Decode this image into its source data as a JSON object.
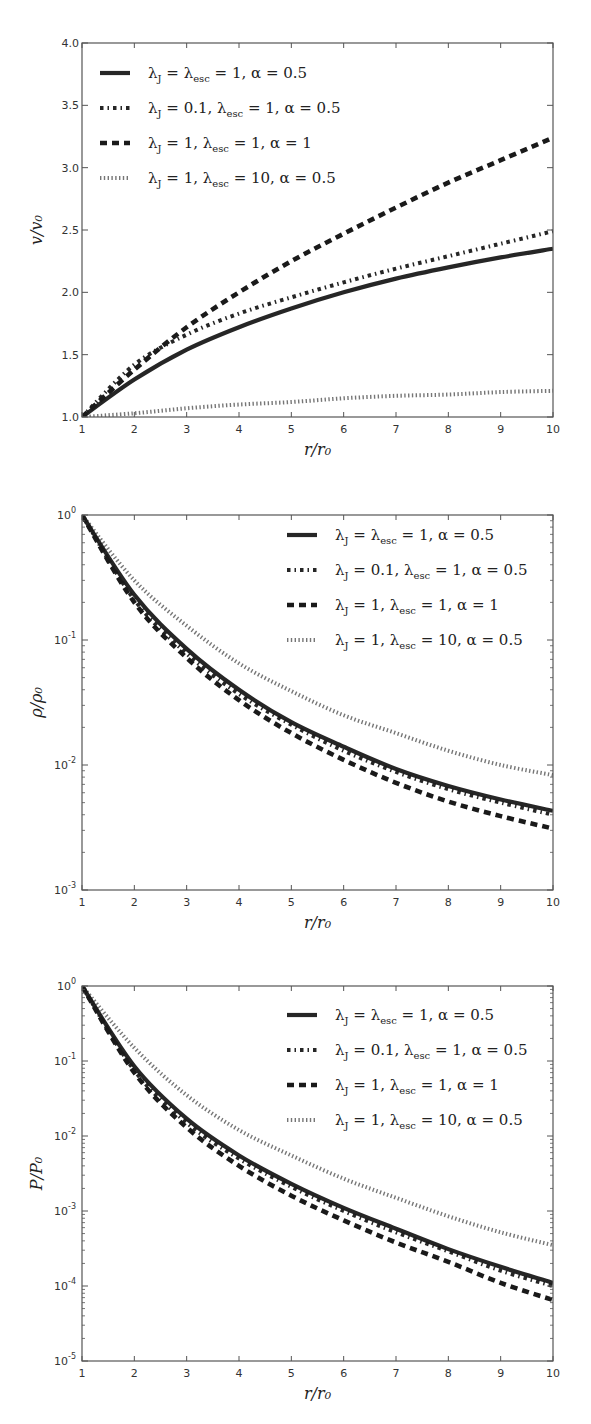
{
  "chart_data": [
    {
      "type": "line",
      "title": "",
      "xlabel": "r/r_0",
      "ylabel": "v/v_0",
      "xscale": "linear",
      "yscale": "linear",
      "xlim": [
        1,
        10
      ],
      "ylim": [
        1.0,
        4.0
      ],
      "xticks": [
        "1",
        "2",
        "3",
        "4",
        "5",
        "6",
        "7",
        "8",
        "9",
        "10"
      ],
      "yticks": [
        "1.0",
        "1.5",
        "2.0",
        "2.5",
        "3.0",
        "3.5",
        "4.0"
      ],
      "grid": false,
      "legend_position": "upper left",
      "x": [
        1,
        2,
        3,
        4,
        5,
        6,
        7,
        8,
        9,
        10
      ],
      "series": [
        {
          "name": "λJ=λesc=1, α=0.5",
          "style": "solid",
          "values": [
            1.0,
            1.3,
            1.54,
            1.72,
            1.87,
            2.0,
            2.11,
            2.2,
            2.28,
            2.35
          ]
        },
        {
          "name": "λJ=0.1, λesc=1, α=0.5",
          "style": "dashdot",
          "values": [
            1.0,
            1.42,
            1.66,
            1.83,
            1.96,
            2.08,
            2.19,
            2.29,
            2.39,
            2.49
          ]
        },
        {
          "name": "λJ=1, λesc=1, α=1",
          "style": "dashed",
          "values": [
            1.0,
            1.38,
            1.72,
            2.0,
            2.25,
            2.47,
            2.68,
            2.88,
            3.06,
            3.24
          ]
        },
        {
          "name": "λJ=1, λesc=10, α=0.5",
          "style": "dotted",
          "values": [
            1.0,
            1.03,
            1.07,
            1.1,
            1.12,
            1.15,
            1.17,
            1.18,
            1.2,
            1.21
          ]
        }
      ]
    },
    {
      "type": "line",
      "title": "",
      "xlabel": "r/r_0",
      "ylabel": "ρ/ρ_0",
      "xscale": "linear",
      "yscale": "log",
      "xlim": [
        1,
        10
      ],
      "ylim": [
        0.001,
        1
      ],
      "xticks": [
        "1",
        "2",
        "3",
        "4",
        "5",
        "6",
        "7",
        "8",
        "9",
        "10"
      ],
      "yticks": [
        "10^-3",
        "10^-2",
        "10^-1",
        "10^0"
      ],
      "grid": false,
      "legend_position": "upper right",
      "x": [
        1,
        2,
        3,
        4,
        5,
        6,
        7,
        8,
        9,
        10
      ],
      "series": [
        {
          "name": "λJ=λesc=1, α=0.5",
          "style": "solid",
          "values": [
            1.0,
            0.23,
            0.085,
            0.04,
            0.022,
            0.014,
            0.0093,
            0.0068,
            0.0053,
            0.0043
          ]
        },
        {
          "name": "λJ=0.1, λesc=1, α=0.5",
          "style": "dashdot",
          "values": [
            1.0,
            0.21,
            0.078,
            0.037,
            0.021,
            0.013,
            0.0088,
            0.0064,
            0.005,
            0.004
          ]
        },
        {
          "name": "λJ=1, λesc=1, α=1",
          "style": "dashed",
          "values": [
            1.0,
            0.2,
            0.072,
            0.033,
            0.018,
            0.011,
            0.0072,
            0.0051,
            0.0039,
            0.0031
          ]
        },
        {
          "name": "λJ=1, λesc=10, α=0.5",
          "style": "dotted",
          "values": [
            1.0,
            0.3,
            0.13,
            0.065,
            0.039,
            0.025,
            0.018,
            0.013,
            0.01,
            0.0083
          ]
        }
      ]
    },
    {
      "type": "line",
      "title": "",
      "xlabel": "r/r_0",
      "ylabel": "P/P_0",
      "xscale": "linear",
      "yscale": "log",
      "xlim": [
        1,
        10
      ],
      "ylim": [
        1e-05,
        1
      ],
      "xticks": [
        "1",
        "2",
        "3",
        "4",
        "5",
        "6",
        "7",
        "8",
        "9",
        "10"
      ],
      "yticks": [
        "10^-5",
        "10^-4",
        "10^-3",
        "10^-2",
        "10^-1",
        "10^0"
      ],
      "grid": false,
      "legend_position": "upper right",
      "x": [
        1,
        2,
        3,
        4,
        5,
        6,
        7,
        8,
        9,
        10
      ],
      "series": [
        {
          "name": "λJ=λesc=1, α=0.5",
          "style": "solid",
          "values": [
            1.0,
            0.085,
            0.017,
            0.0055,
            0.0023,
            0.0011,
            0.00058,
            0.00031,
            0.00018,
            0.00011
          ]
        },
        {
          "name": "λJ=0.1, λesc=1, α=0.5",
          "style": "dashdot",
          "values": [
            1.0,
            0.075,
            0.015,
            0.005,
            0.0021,
            0.001,
            0.00052,
            0.00029,
            0.00016,
            0.0001
          ]
        },
        {
          "name": "λJ=1, λesc=1, α=1",
          "style": "dashed",
          "values": [
            1.0,
            0.07,
            0.013,
            0.004,
            0.0016,
            0.00075,
            0.00038,
            0.00021,
            0.00011,
            6.5e-05
          ]
        },
        {
          "name": "λJ=1, λesc=10, α=0.5",
          "style": "dotted",
          "values": [
            1.0,
            0.15,
            0.035,
            0.012,
            0.0055,
            0.0027,
            0.0015,
            0.00085,
            0.00052,
            0.00035
          ]
        }
      ]
    }
  ],
  "figures": [
    {
      "ylabel": "v/v₀",
      "xlabel": "r/r₀",
      "yticks": [
        "1.0",
        "1.5",
        "2.0",
        "2.5",
        "3.0",
        "3.5",
        "4.0"
      ],
      "xticks": [
        "1",
        "2",
        "3",
        "4",
        "5",
        "6",
        "7",
        "8",
        "9",
        "10"
      ],
      "legend": [
        {
          "label": "λ",
          "sub": "J",
          "rest": " = λ",
          "sub2": "esc",
          "rest2": " = 1,  α = 0.5"
        },
        {
          "label": "λ",
          "sub": "J",
          "rest": " = 0.1,  λ",
          "sub2": "esc",
          "rest2": " = 1,  α = 0.5"
        },
        {
          "label": "λ",
          "sub": "J",
          "rest": " = 1,  λ",
          "sub2": "esc",
          "rest2": " = 1,  α = 1"
        },
        {
          "label": "λ",
          "sub": "J",
          "rest": " = 1,  λ",
          "sub2": "esc",
          "rest2": " = 10,  α = 0.5"
        }
      ]
    },
    {
      "ylabel": "ρ/ρ₀",
      "xlabel": "r/r₀",
      "yticks": [
        {
          "base": "10",
          "exp": "0"
        },
        {
          "base": "10",
          "exp": "-1"
        },
        {
          "base": "10",
          "exp": "-2"
        },
        {
          "base": "10",
          "exp": "-3"
        }
      ],
      "xticks": [
        "1",
        "2",
        "3",
        "4",
        "5",
        "6",
        "7",
        "8",
        "9",
        "10"
      ]
    },
    {
      "ylabel": "P/P₀",
      "xlabel": "r/r₀",
      "yticks": [
        {
          "base": "10",
          "exp": "0"
        },
        {
          "base": "10",
          "exp": "-1"
        },
        {
          "base": "10",
          "exp": "-2"
        },
        {
          "base": "10",
          "exp": "-3"
        },
        {
          "base": "10",
          "exp": "-4"
        },
        {
          "base": "10",
          "exp": "-5"
        }
      ],
      "xticks": [
        "1",
        "2",
        "3",
        "4",
        "5",
        "6",
        "7",
        "8",
        "9",
        "10"
      ]
    }
  ],
  "style": {
    "line_color": "#1a1a1a",
    "axis_color": "#555555",
    "background": "#ffffff"
  }
}
